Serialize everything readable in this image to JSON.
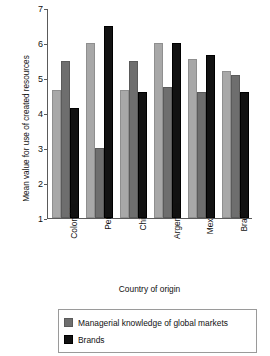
{
  "chart_data": {
    "type": "bar",
    "title": "",
    "xlabel": "Country of origin",
    "ylabel": "Mean value for use of created resources",
    "categories": [
      "Colombia",
      "Peru",
      "Chile",
      "Argentina",
      "Mexico",
      "Brazil"
    ],
    "series": [
      {
        "name": "",
        "color": "#a8a8a8",
        "values": [
          4.65,
          6.0,
          4.65,
          6.0,
          5.55,
          5.2
        ]
      },
      {
        "name": "Managerial knowledge of global markets",
        "color": "#6e6e6e",
        "values": [
          5.5,
          3.0,
          5.5,
          4.75,
          4.6,
          5.1
        ]
      },
      {
        "name": "Brands",
        "color": "#121212",
        "values": [
          4.15,
          6.5,
          4.6,
          6.0,
          5.65,
          4.6
        ]
      }
    ],
    "ylim": [
      1,
      7
    ],
    "yticks": [
      1,
      2,
      3,
      4,
      5,
      6,
      7
    ],
    "grid": false,
    "legend_position": "bottom",
    "legend_entries": [
      {
        "label": "Managerial knowledge of global markets",
        "color": "#6e6e6e"
      },
      {
        "label": "Brands",
        "color": "#121212"
      }
    ]
  }
}
